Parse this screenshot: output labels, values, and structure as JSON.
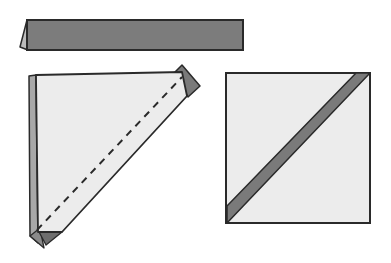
{
  "diagram": {
    "type": "folding-instructions",
    "colors": {
      "background": "#ffffff",
      "paper_light": "#ececec",
      "paper_dark": "#7a7a7a",
      "paper_mid": "#9a9a9a",
      "outline": "#2a2a2a"
    },
    "steps": [
      {
        "id": "step-strip",
        "description": "Folded strip of paper, dark side showing, with small flap on left edge"
      },
      {
        "id": "step-folded-triangle",
        "description": "Square folded diagonally with dashed fold line and dark corner flaps"
      },
      {
        "id": "step-result-square",
        "description": "Finished square with dark diagonal band from lower-left to upper-right"
      }
    ]
  }
}
